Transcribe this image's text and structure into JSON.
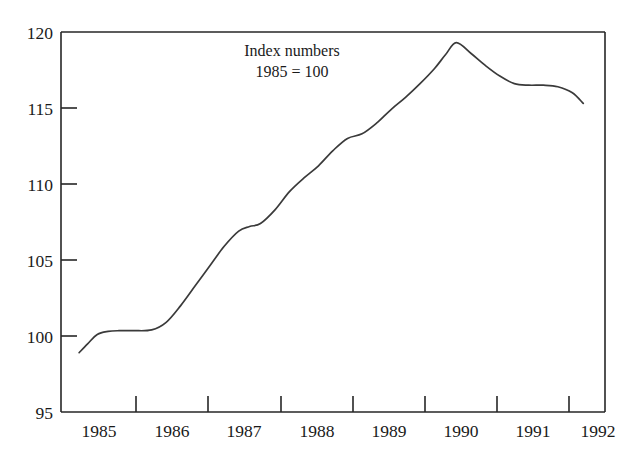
{
  "chart_data": {
    "type": "line",
    "title": "",
    "annotation_lines": [
      "Index numbers",
      "1985 = 100"
    ],
    "xlabel": "",
    "ylabel": "",
    "xlim": [
      1984.75,
      1992.25
    ],
    "ylim": [
      95,
      120
    ],
    "yticks": [
      95,
      100,
      105,
      110,
      115,
      120
    ],
    "ytick_labels": [
      "95",
      "100",
      "105",
      "110",
      "115",
      "120"
    ],
    "xtick_labels": [
      "1985",
      "1986",
      "1987",
      "1988",
      "1989",
      "1990",
      "1991",
      "1992"
    ],
    "xtick_positions": [
      1985.25,
      1986.25,
      1987.25,
      1988.25,
      1989.25,
      1990.25,
      1991.25,
      1992.0
    ],
    "grid": false,
    "legend": null,
    "series": [
      {
        "name": "Index",
        "color": "#3a3a3a",
        "x": [
          1985.0,
          1985.12,
          1985.25,
          1985.4,
          1985.55,
          1985.75,
          1986.0,
          1986.2,
          1986.4,
          1986.6,
          1986.8,
          1987.0,
          1987.2,
          1987.35,
          1987.5,
          1987.7,
          1987.9,
          1988.1,
          1988.3,
          1988.5,
          1988.7,
          1988.9,
          1989.1,
          1989.3,
          1989.5,
          1989.7,
          1989.9,
          1990.05,
          1990.2,
          1990.4,
          1990.6,
          1990.8,
          1991.0,
          1991.2,
          1991.4,
          1991.6,
          1991.8,
          1991.95
        ],
        "y": [
          98.9,
          99.5,
          100.1,
          100.3,
          100.35,
          100.35,
          100.4,
          100.9,
          102.0,
          103.3,
          104.6,
          105.9,
          106.9,
          107.2,
          107.4,
          108.3,
          109.5,
          110.4,
          111.2,
          112.2,
          113.0,
          113.3,
          114.0,
          114.9,
          115.7,
          116.6,
          117.6,
          118.5,
          119.3,
          118.6,
          117.8,
          117.1,
          116.6,
          116.5,
          116.5,
          116.4,
          116.0,
          115.3
        ]
      }
    ]
  },
  "axes": {
    "frame_color": "#262626",
    "background": "#ffffff"
  }
}
